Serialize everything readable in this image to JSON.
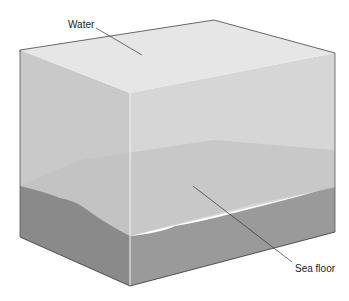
{
  "diagram": {
    "labels": {
      "water": "Water",
      "sea_floor": "Sea floor"
    },
    "colors": {
      "water_top": "#e6e6e6",
      "water_left": "#c9c9c9",
      "water_front": "#d6d6d6",
      "back_floor": "#bdbdbd",
      "sediment_left": "#8a8a8a",
      "sediment_front": "#9a9a9a",
      "outline": "#444444",
      "leader_line": "#333333"
    }
  }
}
